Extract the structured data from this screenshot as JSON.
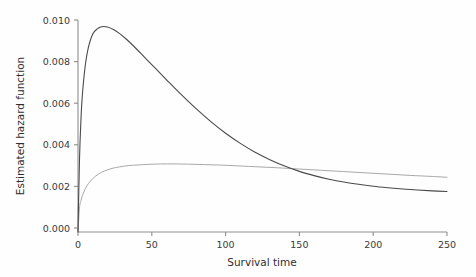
{
  "chart_data": {
    "type": "line",
    "title": "",
    "xlabel": "Survival time",
    "ylabel": "Estimated hazard function",
    "xlim": [
      0,
      250
    ],
    "ylim": [
      0.0,
      0.01
    ],
    "grid": false,
    "legend": "none",
    "xticks": [
      0,
      50,
      100,
      150,
      200,
      250
    ],
    "xtick_labels": [
      "0",
      "50",
      "100",
      "150",
      "200",
      "250"
    ],
    "yticks": [
      0.0,
      0.002,
      0.004,
      0.006,
      0.008,
      0.01
    ],
    "ytick_labels": [
      "0.000",
      "0.002",
      "0.004",
      "0.006",
      "0.008",
      "0.010"
    ],
    "series": [
      {
        "name": "hazard-curve-peaked",
        "color": "#4a4a4a",
        "width": 1.1,
        "x": [
          0,
          1,
          2,
          3,
          5,
          7,
          10,
          13,
          16,
          20,
          24,
          28,
          33,
          38,
          45,
          52,
          60,
          70,
          80,
          90,
          100,
          110,
          120,
          130,
          140,
          150,
          160,
          170,
          180,
          190,
          200,
          210,
          220,
          230,
          240,
          250
        ],
        "values": [
          0.0,
          0.0034,
          0.0053,
          0.0065,
          0.0079,
          0.0087,
          0.00934,
          0.00958,
          0.00968,
          0.00967,
          0.00955,
          0.00937,
          0.00908,
          0.00875,
          0.00825,
          0.00775,
          0.00718,
          0.00648,
          0.00582,
          0.00521,
          0.00466,
          0.00418,
          0.00376,
          0.00341,
          0.00311,
          0.00286,
          0.00266,
          0.00249,
          0.00236,
          0.00225,
          0.00216,
          0.00209,
          0.00203,
          0.00198,
          0.00194,
          0.00191
        ]
      },
      {
        "name": "hazard-curve-plateau",
        "color": "#a8a8a8",
        "width": 1.0,
        "x": [
          0,
          1,
          2,
          3,
          5,
          7,
          10,
          14,
          18,
          23,
          28,
          34,
          40,
          48,
          56,
          65,
          75,
          85,
          95,
          105,
          120,
          135,
          150,
          165,
          180,
          195,
          210,
          225,
          240,
          250
        ],
        "values": [
          0.0,
          0.00112,
          0.00148,
          0.00172,
          0.00205,
          0.00228,
          0.00252,
          0.00274,
          0.00288,
          0.003,
          0.00307,
          0.00313,
          0.00316,
          0.00319,
          0.00321,
          0.00321,
          0.0032,
          0.00318,
          0.00316,
          0.00313,
          0.00308,
          0.00303,
          0.00297,
          0.00291,
          0.00285,
          0.00279,
          0.00273,
          0.00267,
          0.00262,
          0.00258
        ]
      }
    ],
    "annotations": {
      "peak_value": 0.0097,
      "peak_time": 20,
      "crossing_time": 190,
      "crossing_value": 0.00225
    }
  }
}
